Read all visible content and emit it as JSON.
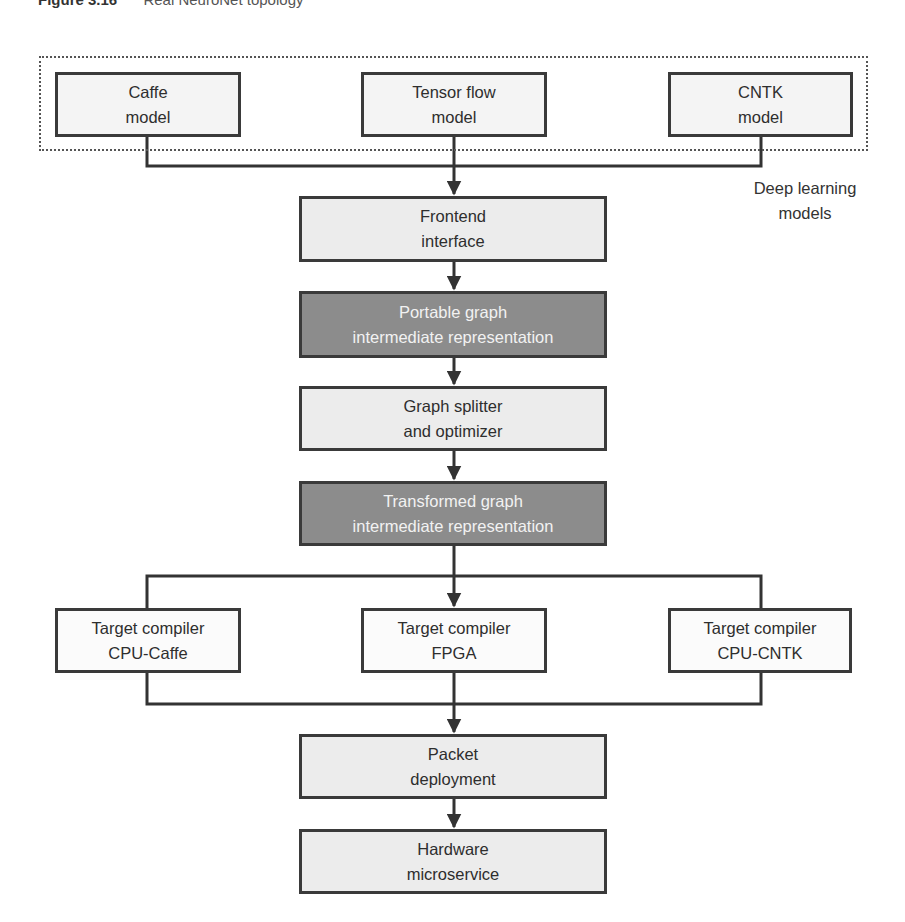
{
  "caption": {
    "figure": "Figure 3.16",
    "title": "Real NeuroNet topology"
  },
  "group": {
    "label_line1": "Deep learning",
    "label_line2": "models"
  },
  "models": [
    {
      "line1": "Caffe",
      "line2": "model"
    },
    {
      "line1": "Tensor flow",
      "line2": "model"
    },
    {
      "line1": "CNTK",
      "line2": "model"
    }
  ],
  "pipeline": {
    "frontend": {
      "line1": "Frontend",
      "line2": "interface"
    },
    "portable": {
      "line1": "Portable graph",
      "line2": "intermediate representation"
    },
    "splitter": {
      "line1": "Graph splitter",
      "line2": "and optimizer"
    },
    "transformed": {
      "line1": "Transformed graph",
      "line2": "intermediate representation"
    },
    "packet": {
      "line1": "Packet",
      "line2": "deployment"
    },
    "hardware": {
      "line1": "Hardware",
      "line2": "microservice"
    }
  },
  "compilers": [
    {
      "line1": "Target compiler",
      "line2": "CPU-Caffe"
    },
    {
      "line1": "Target compiler",
      "line2": "FPGA"
    },
    {
      "line1": "Target compiler",
      "line2": "CPU-CNTK"
    }
  ],
  "colors": {
    "light_box": "#ececec",
    "dark_box": "#8c8c8c",
    "border": "#3a3a3a",
    "dark_text": "#f2f2f2"
  }
}
